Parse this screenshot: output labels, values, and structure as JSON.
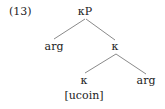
{
  "example_number": "(13)",
  "tree": {
    "root": {
      "label": "κP"
    },
    "root_left": {
      "label": "arg"
    },
    "root_right": {
      "label": "κ"
    },
    "inner_left": {
      "label": "κ",
      "feature": "[ucoin]"
    },
    "inner_right": {
      "label": "arg"
    }
  },
  "edges": [
    {
      "from": "root",
      "to": "root_left"
    },
    {
      "from": "root",
      "to": "root_right"
    },
    {
      "from": "root_right",
      "to": "inner_left"
    },
    {
      "from": "root_right",
      "to": "inner_right"
    }
  ]
}
